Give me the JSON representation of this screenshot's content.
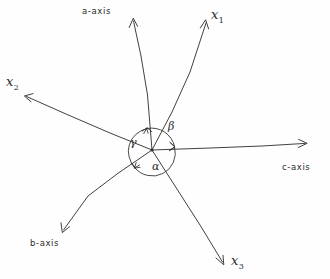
{
  "figure": {
    "background_color": "#fefefe",
    "ink_color": "#2b2b2b",
    "width": 330,
    "height": 279
  },
  "origin": {
    "x": 152,
    "y": 150,
    "label": "origin"
  },
  "axes": [
    {
      "id": "a-axis",
      "label": "a-axis",
      "kind": "crystal-axis",
      "tip": {
        "x": 133,
        "y": 18
      },
      "label_position": {
        "x": 82,
        "y": 6
      }
    },
    {
      "id": "c-axis",
      "label": "c-axis",
      "kind": "crystal-axis",
      "tip": {
        "x": 307,
        "y": 143
      },
      "label_position": {
        "x": 282,
        "y": 162
      }
    },
    {
      "id": "b-axis",
      "label": "b-axis",
      "kind": "crystal-axis",
      "tip": {
        "x": 62,
        "y": 232
      },
      "label_position": {
        "x": 30,
        "y": 238
      }
    }
  ],
  "vectors": [
    {
      "id": "x1",
      "symbol": "x",
      "subscript": "1",
      "kind": "cartesian-axis",
      "tip": {
        "x": 205,
        "y": 20
      },
      "label_position": {
        "x": 211,
        "y": 7
      }
    },
    {
      "id": "x2",
      "symbol": "x",
      "subscript": "2",
      "kind": "cartesian-axis",
      "tip": {
        "x": 24,
        "y": 97
      },
      "label_position": {
        "x": 6,
        "y": 74
      }
    },
    {
      "id": "x3",
      "symbol": "x",
      "subscript": "3",
      "kind": "cartesian-axis",
      "tip": {
        "x": 224,
        "y": 265
      },
      "label_position": {
        "x": 231,
        "y": 253
      }
    }
  ],
  "angles": [
    {
      "id": "alpha",
      "symbol": "α",
      "between": [
        "b-axis",
        "c-axis"
      ],
      "label_position": {
        "x": 152,
        "y": 160
      }
    },
    {
      "id": "beta",
      "symbol": "β",
      "between": [
        "a-axis",
        "c-axis"
      ],
      "label_position": {
        "x": 168,
        "y": 120
      }
    },
    {
      "id": "gamma",
      "symbol": "γ",
      "between": [
        "a-axis",
        "b-axis"
      ],
      "label_position": {
        "x": 130,
        "y": 136
      }
    }
  ]
}
